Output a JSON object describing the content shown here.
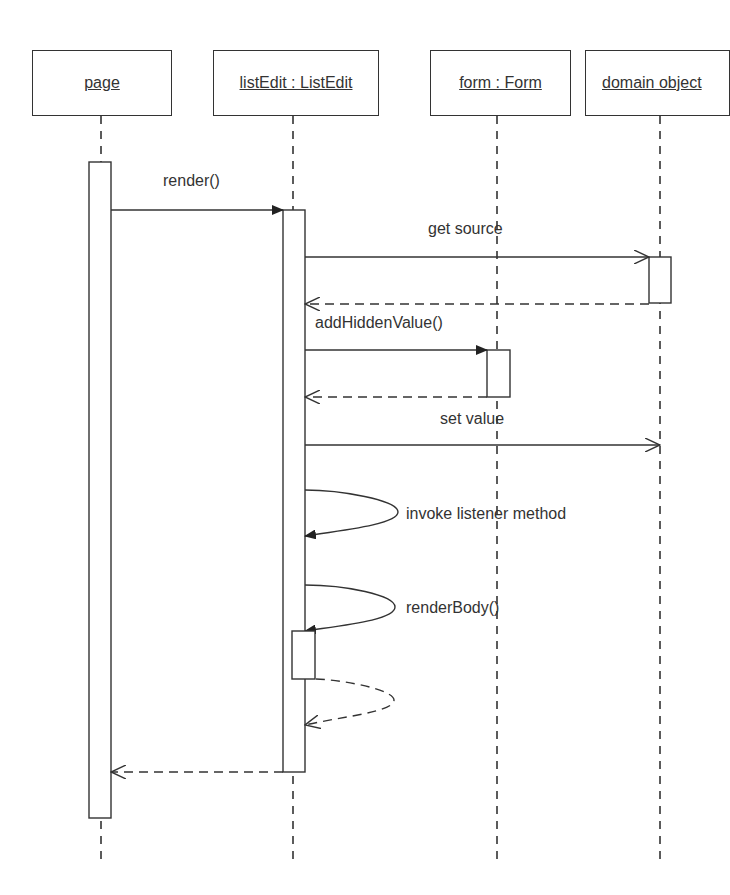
{
  "diagram": {
    "type": "UML sequence diagram",
    "participants": [
      {
        "id": "page",
        "label": "page"
      },
      {
        "id": "listEdit",
        "label": "listEdit : ListEdit"
      },
      {
        "id": "form",
        "label": "form : Form"
      },
      {
        "id": "domain",
        "label": "domain object"
      }
    ],
    "messages": [
      {
        "from": "page",
        "to": "listEdit",
        "label": "render()",
        "kind": "sync"
      },
      {
        "from": "listEdit",
        "to": "domain",
        "label": "get source",
        "kind": "async"
      },
      {
        "from": "domain",
        "to": "listEdit",
        "label": "",
        "kind": "return"
      },
      {
        "from": "listEdit",
        "to": "form",
        "label": "addHiddenValue()",
        "kind": "sync"
      },
      {
        "from": "form",
        "to": "listEdit",
        "label": "",
        "kind": "return"
      },
      {
        "from": "listEdit",
        "to": "domain",
        "label": "set value",
        "kind": "async"
      },
      {
        "from": "listEdit",
        "to": "listEdit",
        "label": "invoke listener method",
        "kind": "self-sync"
      },
      {
        "from": "listEdit",
        "to": "listEdit",
        "label": "renderBody()",
        "kind": "self-sync"
      },
      {
        "from": "listEdit",
        "to": "listEdit",
        "label": "",
        "kind": "self-return"
      },
      {
        "from": "listEdit",
        "to": "page",
        "label": "",
        "kind": "return"
      }
    ]
  }
}
